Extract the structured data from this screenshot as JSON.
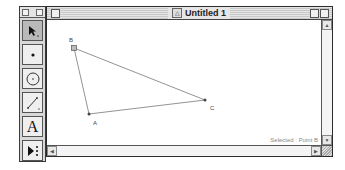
{
  "window": {
    "title": "Untitled 1",
    "status": "Selected : Point B"
  },
  "toolbox": {
    "tools": [
      {
        "name": "selection-arrow",
        "active": true
      },
      {
        "name": "point"
      },
      {
        "name": "compass"
      },
      {
        "name": "straightedge"
      },
      {
        "name": "text",
        "glyph": "A"
      },
      {
        "name": "custom"
      }
    ]
  },
  "sketch": {
    "points": [
      {
        "label": "B",
        "x": 27,
        "y": 33,
        "selected": true
      },
      {
        "label": "A",
        "x": 42,
        "y": 99
      },
      {
        "label": "C",
        "x": 158,
        "y": 85
      }
    ],
    "segments": [
      [
        "B",
        "A"
      ],
      [
        "A",
        "C"
      ],
      [
        "B",
        "C"
      ]
    ]
  },
  "scrollbars": {
    "up": "▲",
    "down": "▼",
    "left": "◀",
    "right": "▶"
  }
}
